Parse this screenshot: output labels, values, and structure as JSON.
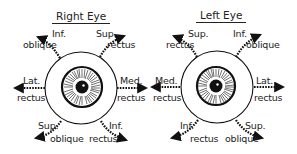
{
  "diagram": {
    "right_eye": {
      "title": "Right Eye",
      "muscles": [
        {
          "line1": "Inf.",
          "line2": "oblique",
          "position": "upper-left"
        },
        {
          "line1": "Sup.",
          "line2": "rectus",
          "position": "upper-right"
        },
        {
          "line1": "Lat.",
          "line2": "rectus",
          "position": "left"
        },
        {
          "line1": "Med.",
          "line2": "rectus",
          "position": "right"
        },
        {
          "line1": "Sup.",
          "line2": "oblique",
          "position": "lower-left"
        },
        {
          "line1": "Inf.",
          "line2": "rectus",
          "position": "lower-right"
        }
      ]
    },
    "left_eye": {
      "title": "Left Eye",
      "muscles": [
        {
          "line1": "Sup.",
          "line2": "rectus",
          "position": "upper-left"
        },
        {
          "line1": "Inf.",
          "line2": "oblique",
          "position": "upper-right"
        },
        {
          "line1": "Med.",
          "line2": "rectus",
          "position": "left"
        },
        {
          "line1": "Lat.",
          "line2": "rectus",
          "position": "right"
        },
        {
          "line1": "Inf.",
          "line2": "rectus",
          "position": "lower-left"
        },
        {
          "line1": "Sup.",
          "line2": "oblique",
          "position": "lower-right"
        }
      ]
    },
    "colors": {
      "ink": "#111111",
      "background": "#ffffff"
    }
  }
}
